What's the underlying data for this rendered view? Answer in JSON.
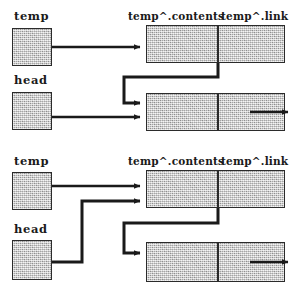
{
  "diagram": {
    "line_color": "#1a1a1a",
    "box_fill": "#c9c9c9",
    "box_border": "#2b2b2b",
    "background": "#ffffff"
  },
  "panels": [
    {
      "id": "before",
      "labels": {
        "temp_var": "temp",
        "head_var": "head",
        "node_contents": "temp^.contents",
        "node_link": "temp^.link"
      },
      "pointers": [
        {
          "name": "temp",
          "target": "node-1",
          "route": "straight"
        },
        {
          "name": "head",
          "target": "node-2",
          "route": "straight"
        },
        {
          "name": "temp^.link",
          "target": "node-2",
          "route": "down-left-down-right"
        },
        {
          "name": "node-2.link",
          "target": "next",
          "route": "straight-out-right"
        }
      ]
    },
    {
      "id": "after",
      "labels": {
        "temp_var": "temp",
        "head_var": "head",
        "node_contents": "temp^.contents",
        "node_link": "temp^.link"
      },
      "pointers": [
        {
          "name": "temp",
          "target": "node-1",
          "route": "straight"
        },
        {
          "name": "head",
          "target": "node-1",
          "route": "right-up-right"
        },
        {
          "name": "temp^.link",
          "target": "node-2",
          "route": "down-left-down-right"
        },
        {
          "name": "node-2.link",
          "target": "next",
          "route": "straight-out-right"
        }
      ]
    }
  ]
}
